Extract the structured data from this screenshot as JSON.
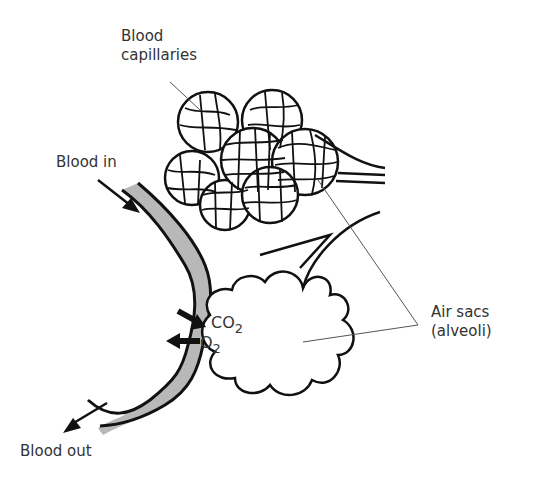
{
  "diagram": {
    "type": "biology-illustration",
    "labels": {
      "capillaries_line1": "Blood",
      "capillaries_line2": "capillaries",
      "blood_in": "Blood in",
      "blood_out": "Blood out",
      "co2_base": "CO",
      "co2_sub": "2",
      "o2_base": "O",
      "o2_sub": "2",
      "air_sacs_line1": "Air sacs",
      "air_sacs_line2": "(alveoli)"
    },
    "colors": {
      "vessel_fill": "#b8b8b8",
      "outline": "#111111",
      "text": "#333333",
      "leader_line": "#555555"
    }
  }
}
